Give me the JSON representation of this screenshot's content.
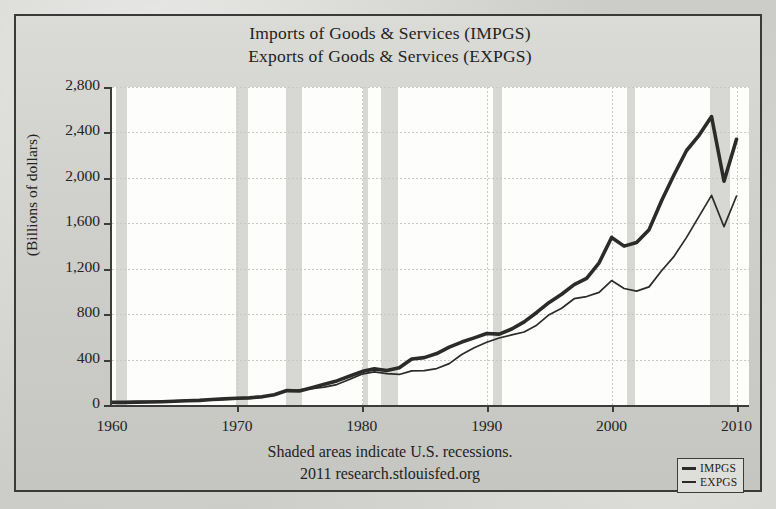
{
  "titles": [
    "Imports of Goods & Services (IMPGS)",
    "Exports of Goods & Services (EXPGS)"
  ],
  "ylabel": "(Billions of dollars)",
  "footer": {
    "line1": "Shaded areas indicate U.S. recessions.",
    "line2": "2011 research.stlouisfed.org"
  },
  "legend": [
    {
      "label": "IMPGS",
      "style": "thick",
      "color": "#2b2b29"
    },
    {
      "label": "EXPGS",
      "style": "thin",
      "color": "#2b2b29"
    }
  ],
  "colors": {
    "paper": "#ccccc8",
    "plot_bg": "#fdfdfc",
    "band": "#d7d7d4",
    "axis": "#3c3c3a",
    "line": "#2b2b29",
    "grid": "#c9c9c6"
  },
  "chart_data": {
    "type": "line",
    "xlabel": "",
    "ylabel": "(Billions of dollars)",
    "xlim": [
      1960,
      2011
    ],
    "ylim": [
      0,
      2800
    ],
    "yticks": [
      0,
      400,
      800,
      1200,
      1600,
      2000,
      2400,
      2800
    ],
    "ytick_labels": [
      "0",
      "400",
      "800",
      "1,200",
      "1,600",
      "2,000",
      "2,400",
      "2,800"
    ],
    "xticks": [
      1960,
      1970,
      1980,
      1990,
      2000,
      2010
    ],
    "xtick_labels": [
      "1960",
      "1970",
      "1980",
      "1990",
      "2000",
      "2010"
    ],
    "grid": true,
    "legend_position": "bottom-right",
    "annotation": "Shaded areas indicate U.S. recessions.",
    "x": [
      1960,
      1961,
      1962,
      1963,
      1964,
      1965,
      1966,
      1967,
      1968,
      1969,
      1970,
      1971,
      1972,
      1973,
      1974,
      1975,
      1976,
      1977,
      1978,
      1979,
      1980,
      1981,
      1982,
      1983,
      1984,
      1985,
      1986,
      1987,
      1988,
      1989,
      1990,
      1991,
      1992,
      1993,
      1994,
      1995,
      1996,
      1997,
      1998,
      1999,
      2000,
      2001,
      2002,
      2003,
      2004,
      2005,
      2006,
      2007,
      2008,
      2009,
      2010
    ],
    "series": [
      {
        "name": "IMPGS",
        "width": "thick",
        "values": [
          23,
          23,
          25,
          27,
          29,
          33,
          38,
          41,
          49,
          54,
          59,
          63,
          73,
          91,
          127,
          123,
          152,
          182,
          212,
          253,
          294,
          318,
          303,
          328,
          405,
          417,
          453,
          509,
          554,
          591,
          630,
          624,
          669,
          732,
          815,
          903,
          975,
          1060,
          1115,
          1252,
          1475,
          1399,
          1430,
          1544,
          1798,
          2027,
          2241,
          2375,
          2540,
          1970,
          2340
        ]
      },
      {
        "name": "EXPGS",
        "width": "thin",
        "values": [
          27,
          28,
          30,
          32,
          35,
          37,
          41,
          44,
          48,
          52,
          58,
          60,
          67,
          91,
          121,
          133,
          143,
          157,
          180,
          224,
          272,
          291,
          277,
          269,
          300,
          302,
          321,
          364,
          445,
          504,
          552,
          590,
          617,
          643,
          703,
          795,
          852,
          936,
          955,
          992,
          1096,
          1026,
          1003,
          1040,
          1182,
          1309,
          1476,
          1661,
          1846,
          1570,
          1840
        ]
      }
    ],
    "recession_bands": [
      {
        "start": 1960.3,
        "end": 1961.2
      },
      {
        "start": 1969.9,
        "end": 1970.9
      },
      {
        "start": 1973.9,
        "end": 1975.2
      },
      {
        "start": 1980.1,
        "end": 1980.5
      },
      {
        "start": 1981.5,
        "end": 1982.9
      },
      {
        "start": 1990.5,
        "end": 1991.2
      },
      {
        "start": 2001.2,
        "end": 2001.9
      },
      {
        "start": 2007.9,
        "end": 2009.5
      }
    ]
  }
}
